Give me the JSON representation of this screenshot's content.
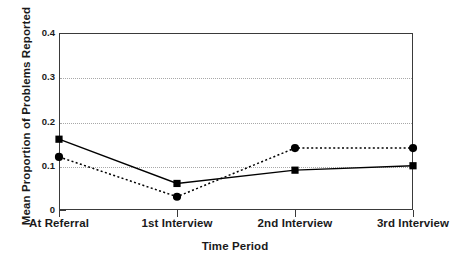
{
  "chart_data": {
    "type": "line",
    "title": "",
    "xlabel": "Time Period",
    "ylabel": "Mean Proportion of Problems Reported",
    "categories": [
      "At Referral",
      "1st Interview",
      "2nd Interview",
      "3rd Interview"
    ],
    "ylim": [
      0,
      0.4
    ],
    "yticks": [
      0,
      0.1,
      0.2,
      0.3,
      0.4
    ],
    "ytick_labels": [
      "0",
      "0.1",
      "0.2",
      "0.3",
      "0.4"
    ],
    "yminor_ticks": [
      0.05,
      0.15,
      0.25,
      0.35
    ],
    "grid": "horizontal dotted gridlines at 0.1, 0.2, 0.3",
    "gridlines": [
      0.1,
      0.2,
      0.3
    ],
    "legend": "none",
    "legend_position": "none",
    "series": [
      {
        "name": "Series 1",
        "marker": "square",
        "line_style": "solid",
        "color": "#000000",
        "values": [
          0.16,
          0.06,
          0.09,
          0.1
        ]
      },
      {
        "name": "Series 2",
        "marker": "circle",
        "line_style": "dotted",
        "color": "#000000",
        "values": [
          0.12,
          0.03,
          0.14,
          0.14
        ]
      }
    ]
  },
  "axes": {
    "y_title": "Mean Proportion of Problems Reported",
    "x_title": "Time Period"
  },
  "colors": {
    "axis": "#3a3a3a",
    "grid": "#a8a8a8",
    "ink": "#000000",
    "background": "#ffffff"
  }
}
